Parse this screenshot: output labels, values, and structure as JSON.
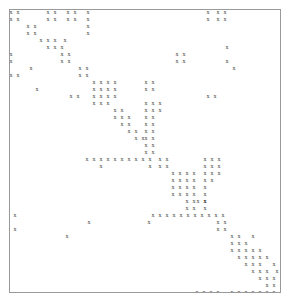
{
  "figure": {
    "kind": "sparse-matrix-spy-plot",
    "marker_glyph": "x",
    "marker_color": "#3a3a3a",
    "frame_color": "#9a9a9a",
    "background_color": "#ffffff",
    "title": "",
    "xlabel": "",
    "ylabel": ""
  },
  "chart_data": {
    "type": "scatter",
    "title": "",
    "xlabel": "",
    "ylabel": "",
    "grid": false,
    "legend": null,
    "n_rows": 46,
    "n_cols": 44,
    "xlim": [
      0,
      44
    ],
    "ylim": [
      0,
      46
    ],
    "marker": "x",
    "points": [
      [
        0,
        0
      ],
      [
        1,
        0
      ],
      [
        15,
        0
      ],
      [
        16,
        0
      ],
      [
        20,
        0
      ],
      [
        21,
        0
      ],
      [
        25,
        0
      ],
      [
        33,
        0
      ],
      [
        35,
        0
      ],
      [
        36,
        0
      ],
      [
        0,
        1
      ],
      [
        1,
        1
      ],
      [
        15,
        1
      ],
      [
        16,
        1
      ],
      [
        20,
        1
      ],
      [
        21,
        1
      ],
      [
        25,
        1
      ],
      [
        33,
        1
      ],
      [
        35,
        1
      ],
      [
        36,
        1
      ],
      [
        3,
        2
      ],
      [
        4,
        2
      ],
      [
        25,
        2
      ],
      [
        3,
        3
      ],
      [
        4,
        3
      ],
      [
        25,
        3
      ],
      [
        6,
        4
      ],
      [
        7,
        4
      ],
      [
        9,
        4
      ],
      [
        19,
        4
      ],
      [
        20,
        4
      ],
      [
        6,
        5
      ],
      [
        7,
        5
      ],
      [
        8,
        5
      ],
      [
        9,
        5
      ],
      [
        19,
        5
      ],
      [
        20,
        5
      ],
      [
        8,
        6
      ],
      [
        9,
        6
      ],
      [
        0,
        7
      ],
      [
        13,
        7
      ],
      [
        14,
        7
      ],
      [
        27,
        7
      ],
      [
        0,
        8
      ],
      [
        13,
        8
      ],
      [
        14,
        8
      ],
      [
        2,
        9
      ],
      [
        18,
        9
      ],
      [
        19,
        9
      ],
      [
        20,
        9
      ],
      [
        18,
        10
      ],
      [
        19,
        10
      ],
      [
        20,
        10
      ],
      [
        6,
        11
      ],
      [
        18,
        11
      ],
      [
        19,
        11
      ],
      [
        20,
        11
      ],
      [
        18,
        12
      ],
      [
        19,
        12
      ],
      [
        20,
        12
      ],
      [
        21,
        12
      ],
      [
        1,
        13
      ],
      [
        2,
        13
      ],
      [
        22,
        13
      ],
      [
        23,
        14
      ],
      [
        26,
        14
      ],
      [
        12,
        15
      ],
      [
        24,
        15
      ],
      [
        27,
        15
      ],
      [
        25,
        16
      ],
      [
        27,
        16
      ],
      [
        30,
        17
      ],
      [
        31,
        17
      ],
      [
        32,
        17
      ],
      [
        33,
        17
      ],
      [
        30,
        18
      ],
      [
        31,
        18
      ],
      [
        32,
        18
      ],
      [
        33,
        18
      ],
      [
        30,
        19
      ],
      [
        31,
        19
      ],
      [
        32,
        19
      ],
      [
        33,
        19
      ],
      [
        35,
        19
      ],
      [
        36,
        19
      ],
      [
        30,
        20
      ],
      [
        31,
        20
      ],
      [
        32,
        20
      ],
      [
        33,
        20
      ],
      [
        35,
        20
      ],
      [
        36,
        20
      ],
      [
        34,
        21
      ],
      [
        35,
        21
      ],
      [
        36,
        21
      ],
      [
        34,
        22
      ],
      [
        35,
        22
      ],
      [
        36,
        22
      ],
      [
        34,
        23
      ],
      [
        35,
        23
      ],
      [
        36,
        23
      ],
      [
        37,
        23
      ],
      [
        37,
        24
      ],
      [
        38,
        24
      ],
      [
        39,
        24
      ],
      [
        38,
        25
      ],
      [
        39,
        25
      ],
      [
        40,
        25
      ],
      [
        39,
        26
      ],
      [
        40,
        26
      ],
      [
        41,
        26
      ],
      [
        40,
        27
      ],
      [
        41,
        27
      ],
      [
        42,
        27
      ],
      [
        43,
        27
      ],
      [
        2,
        12
      ],
      [
        12,
        12
      ],
      [
        14,
        9
      ],
      [
        15,
        9
      ],
      [
        16,
        9
      ],
      [
        17,
        9
      ],
      [
        14,
        10
      ],
      [
        15,
        10
      ],
      [
        16,
        10
      ],
      [
        17,
        10
      ],
      [
        14,
        11
      ],
      [
        15,
        11
      ],
      [
        16,
        11
      ],
      [
        17,
        11
      ],
      [
        13,
        14
      ],
      [
        14,
        14
      ],
      [
        15,
        14
      ],
      [
        15,
        15
      ],
      [
        16,
        15
      ],
      [
        17,
        15
      ],
      [
        17,
        16
      ],
      [
        18,
        16
      ],
      [
        19,
        16
      ],
      [
        11,
        17
      ],
      [
        12,
        17
      ],
      [
        13,
        17
      ],
      [
        14,
        17
      ],
      [
        15,
        17
      ],
      [
        16,
        17
      ],
      [
        17,
        17
      ],
      [
        18,
        17
      ],
      [
        19,
        17
      ],
      [
        20,
        17
      ],
      [
        21,
        17
      ],
      [
        14,
        18
      ],
      [
        22,
        18
      ],
      [
        0,
        19
      ],
      [
        14,
        19
      ],
      [
        23,
        19
      ]
    ],
    "marker_pixels": [
      {
        "x": 10,
        "y": 11
      },
      {
        "x": 17,
        "y": 11
      },
      {
        "x": 47,
        "y": 11
      },
      {
        "x": 54,
        "y": 11
      },
      {
        "x": 67,
        "y": 11
      },
      {
        "x": 74,
        "y": 11
      },
      {
        "x": 87,
        "y": 11
      },
      {
        "x": 207,
        "y": 11
      },
      {
        "x": 217,
        "y": 11
      },
      {
        "x": 224,
        "y": 11
      },
      {
        "x": 10,
        "y": 18
      },
      {
        "x": 17,
        "y": 18
      },
      {
        "x": 47,
        "y": 18
      },
      {
        "x": 54,
        "y": 18
      },
      {
        "x": 67,
        "y": 18
      },
      {
        "x": 74,
        "y": 18
      },
      {
        "x": 87,
        "y": 18
      },
      {
        "x": 207,
        "y": 18
      },
      {
        "x": 217,
        "y": 18
      },
      {
        "x": 224,
        "y": 18
      },
      {
        "x": 27,
        "y": 25
      },
      {
        "x": 34,
        "y": 25
      },
      {
        "x": 87,
        "y": 25
      },
      {
        "x": 27,
        "y": 32
      },
      {
        "x": 34,
        "y": 32
      },
      {
        "x": 87,
        "y": 32
      },
      {
        "x": 47,
        "y": 39
      },
      {
        "x": 54,
        "y": 39
      },
      {
        "x": 64,
        "y": 39
      },
      {
        "x": 47,
        "y": 46
      },
      {
        "x": 54,
        "y": 46
      },
      {
        "x": 61,
        "y": 46
      },
      {
        "x": 226,
        "y": 46
      },
      {
        "x": 61,
        "y": 53
      },
      {
        "x": 68,
        "y": 53
      },
      {
        "x": 61,
        "y": 60
      },
      {
        "x": 68,
        "y": 60
      },
      {
        "x": 10,
        "y": 53
      },
      {
        "x": 10,
        "y": 60
      },
      {
        "x": 176,
        "y": 53
      },
      {
        "x": 183,
        "y": 53
      },
      {
        "x": 176,
        "y": 60
      },
      {
        "x": 183,
        "y": 60
      },
      {
        "x": 226,
        "y": 60
      },
      {
        "x": 233,
        "y": 67
      },
      {
        "x": 79,
        "y": 67
      },
      {
        "x": 86,
        "y": 67
      },
      {
        "x": 79,
        "y": 74
      },
      {
        "x": 86,
        "y": 74
      },
      {
        "x": 10,
        "y": 74
      },
      {
        "x": 17,
        "y": 74
      },
      {
        "x": 30,
        "y": 67
      },
      {
        "x": 93,
        "y": 81
      },
      {
        "x": 100,
        "y": 81
      },
      {
        "x": 107,
        "y": 81
      },
      {
        "x": 114,
        "y": 81
      },
      {
        "x": 93,
        "y": 88
      },
      {
        "x": 100,
        "y": 88
      },
      {
        "x": 107,
        "y": 88
      },
      {
        "x": 114,
        "y": 88
      },
      {
        "x": 93,
        "y": 95
      },
      {
        "x": 100,
        "y": 95
      },
      {
        "x": 107,
        "y": 95
      },
      {
        "x": 114,
        "y": 95
      },
      {
        "x": 93,
        "y": 102
      },
      {
        "x": 100,
        "y": 102
      },
      {
        "x": 107,
        "y": 102
      },
      {
        "x": 145,
        "y": 81
      },
      {
        "x": 152,
        "y": 81
      },
      {
        "x": 145,
        "y": 88
      },
      {
        "x": 152,
        "y": 88
      },
      {
        "x": 70,
        "y": 95
      },
      {
        "x": 77,
        "y": 95
      },
      {
        "x": 207,
        "y": 95
      },
      {
        "x": 214,
        "y": 95
      },
      {
        "x": 114,
        "y": 109
      },
      {
        "x": 121,
        "y": 109
      },
      {
        "x": 114,
        "y": 116
      },
      {
        "x": 121,
        "y": 116
      },
      {
        "x": 128,
        "y": 116
      },
      {
        "x": 121,
        "y": 123
      },
      {
        "x": 128,
        "y": 123
      },
      {
        "x": 128,
        "y": 130
      },
      {
        "x": 135,
        "y": 130
      },
      {
        "x": 135,
        "y": 137
      },
      {
        "x": 142,
        "y": 137
      },
      {
        "x": 145,
        "y": 102
      },
      {
        "x": 152,
        "y": 102
      },
      {
        "x": 159,
        "y": 102
      },
      {
        "x": 145,
        "y": 109
      },
      {
        "x": 152,
        "y": 109
      },
      {
        "x": 159,
        "y": 109
      },
      {
        "x": 145,
        "y": 116
      },
      {
        "x": 152,
        "y": 116
      },
      {
        "x": 145,
        "y": 123
      },
      {
        "x": 152,
        "y": 123
      },
      {
        "x": 145,
        "y": 130
      },
      {
        "x": 152,
        "y": 130
      },
      {
        "x": 145,
        "y": 137
      },
      {
        "x": 152,
        "y": 137
      },
      {
        "x": 145,
        "y": 144
      },
      {
        "x": 152,
        "y": 144
      },
      {
        "x": 145,
        "y": 151
      },
      {
        "x": 152,
        "y": 151
      },
      {
        "x": 86,
        "y": 158
      },
      {
        "x": 93,
        "y": 158
      },
      {
        "x": 100,
        "y": 158
      },
      {
        "x": 107,
        "y": 158
      },
      {
        "x": 114,
        "y": 158
      },
      {
        "x": 121,
        "y": 158
      },
      {
        "x": 128,
        "y": 158
      },
      {
        "x": 135,
        "y": 158
      },
      {
        "x": 142,
        "y": 158
      },
      {
        "x": 149,
        "y": 158
      },
      {
        "x": 100,
        "y": 165
      },
      {
        "x": 149,
        "y": 165
      },
      {
        "x": 159,
        "y": 158
      },
      {
        "x": 166,
        "y": 158
      },
      {
        "x": 159,
        "y": 165
      },
      {
        "x": 166,
        "y": 165
      },
      {
        "x": 204,
        "y": 158
      },
      {
        "x": 211,
        "y": 158
      },
      {
        "x": 218,
        "y": 158
      },
      {
        "x": 204,
        "y": 165
      },
      {
        "x": 211,
        "y": 165
      },
      {
        "x": 218,
        "y": 165
      },
      {
        "x": 172,
        "y": 172
      },
      {
        "x": 179,
        "y": 172
      },
      {
        "x": 186,
        "y": 172
      },
      {
        "x": 193,
        "y": 172
      },
      {
        "x": 172,
        "y": 179
      },
      {
        "x": 179,
        "y": 179
      },
      {
        "x": 186,
        "y": 179
      },
      {
        "x": 193,
        "y": 179
      },
      {
        "x": 172,
        "y": 186
      },
      {
        "x": 179,
        "y": 186
      },
      {
        "x": 186,
        "y": 186
      },
      {
        "x": 193,
        "y": 186
      },
      {
        "x": 172,
        "y": 193
      },
      {
        "x": 179,
        "y": 193
      },
      {
        "x": 186,
        "y": 193
      },
      {
        "x": 193,
        "y": 193
      },
      {
        "x": 204,
        "y": 172
      },
      {
        "x": 211,
        "y": 172
      },
      {
        "x": 218,
        "y": 172
      },
      {
        "x": 204,
        "y": 179
      },
      {
        "x": 211,
        "y": 179
      },
      {
        "x": 204,
        "y": 186
      },
      {
        "x": 204,
        "y": 193
      },
      {
        "x": 204,
        "y": 200
      },
      {
        "x": 204,
        "y": 207
      },
      {
        "x": 186,
        "y": 200
      },
      {
        "x": 193,
        "y": 200
      },
      {
        "x": 186,
        "y": 207
      },
      {
        "x": 193,
        "y": 207
      },
      {
        "x": 14,
        "y": 214
      },
      {
        "x": 14,
        "y": 228
      },
      {
        "x": 88,
        "y": 221
      },
      {
        "x": 66,
        "y": 235
      },
      {
        "x": 148,
        "y": 221
      },
      {
        "x": 152,
        "y": 214
      },
      {
        "x": 159,
        "y": 214
      },
      {
        "x": 166,
        "y": 214
      },
      {
        "x": 173,
        "y": 214
      },
      {
        "x": 180,
        "y": 214
      },
      {
        "x": 187,
        "y": 214
      },
      {
        "x": 194,
        "y": 214
      },
      {
        "x": 201,
        "y": 214
      },
      {
        "x": 208,
        "y": 214
      },
      {
        "x": 215,
        "y": 214
      },
      {
        "x": 222,
        "y": 214
      },
      {
        "x": 197,
        "y": 200
      },
      {
        "x": 204,
        "y": 200
      },
      {
        "x": 217,
        "y": 221
      },
      {
        "x": 224,
        "y": 221
      },
      {
        "x": 217,
        "y": 228
      },
      {
        "x": 224,
        "y": 228
      },
      {
        "x": 231,
        "y": 235
      },
      {
        "x": 238,
        "y": 235
      },
      {
        "x": 252,
        "y": 235
      },
      {
        "x": 231,
        "y": 242
      },
      {
        "x": 238,
        "y": 242
      },
      {
        "x": 245,
        "y": 242
      },
      {
        "x": 231,
        "y": 249
      },
      {
        "x": 238,
        "y": 249
      },
      {
        "x": 245,
        "y": 249
      },
      {
        "x": 252,
        "y": 249
      },
      {
        "x": 259,
        "y": 249
      },
      {
        "x": 238,
        "y": 256
      },
      {
        "x": 245,
        "y": 256
      },
      {
        "x": 252,
        "y": 256
      },
      {
        "x": 259,
        "y": 256
      },
      {
        "x": 266,
        "y": 256
      },
      {
        "x": 245,
        "y": 263
      },
      {
        "x": 252,
        "y": 263
      },
      {
        "x": 259,
        "y": 263
      },
      {
        "x": 252,
        "y": 270
      },
      {
        "x": 259,
        "y": 270
      },
      {
        "x": 266,
        "y": 270
      },
      {
        "x": 259,
        "y": 277
      },
      {
        "x": 266,
        "y": 277
      },
      {
        "x": 273,
        "y": 277
      },
      {
        "x": 266,
        "y": 284
      },
      {
        "x": 273,
        "y": 284
      },
      {
        "x": 196,
        "y": 291
      },
      {
        "x": 203,
        "y": 291
      },
      {
        "x": 210,
        "y": 291
      },
      {
        "x": 217,
        "y": 291
      },
      {
        "x": 231,
        "y": 291
      },
      {
        "x": 238,
        "y": 291
      },
      {
        "x": 245,
        "y": 291
      },
      {
        "x": 252,
        "y": 291
      },
      {
        "x": 259,
        "y": 291
      },
      {
        "x": 266,
        "y": 291
      },
      {
        "x": 273,
        "y": 291
      },
      {
        "x": 273,
        "y": 263
      },
      {
        "x": 276,
        "y": 270
      },
      {
        "x": 40,
        "y": 39
      },
      {
        "x": 36,
        "y": 88
      }
    ]
  }
}
